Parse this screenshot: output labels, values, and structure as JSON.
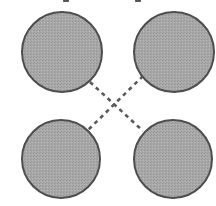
{
  "diagram": {
    "width": 216,
    "height": 206,
    "background": "#ffffff",
    "node_fill": "#a8a8a8",
    "node_stroke": "#4d4d4d",
    "edge_color": "#5a5a5a",
    "edge_dash": "4 4",
    "nodes": [
      {
        "id": "top-left",
        "cx": 62,
        "cy": 52,
        "r": 40
      },
      {
        "id": "top-right",
        "cx": 174,
        "cy": 52,
        "r": 40
      },
      {
        "id": "bottom-left",
        "cx": 61,
        "cy": 159,
        "r": 39
      },
      {
        "id": "bottom-right",
        "cx": 173,
        "cy": 159,
        "r": 39
      }
    ],
    "edges": [
      {
        "id": "tl-to-br",
        "from": "top-left",
        "to": "bottom-right",
        "x1": 90,
        "y1": 82,
        "x2": 143,
        "y2": 131,
        "style": "dashed"
      },
      {
        "id": "tr-to-bl",
        "from": "top-right",
        "to": "bottom-left",
        "x1": 143,
        "y1": 76,
        "x2": 85,
        "y2": 133,
        "style": "dashed"
      }
    ],
    "top_fragments": [
      {
        "x": 63
      },
      {
        "x": 135
      }
    ]
  }
}
